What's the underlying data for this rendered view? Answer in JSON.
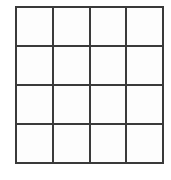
{
  "figure": {
    "name": "empty-4x4-grid",
    "type": "grid",
    "rows": 4,
    "columns": 4,
    "cell_count": 16,
    "line_color": "#3a3a3a",
    "line_width_px": 2,
    "cell_fill_color": "#fdfdfd",
    "background_color": "#ffffff",
    "geometry": {
      "left_px": 15,
      "top_px": 6,
      "width_px": 149,
      "height_px": 158,
      "cell_width_px": 37.25,
      "cell_height_px": 39.5
    },
    "cells": [
      {
        "row": 1,
        "column": 1,
        "label": ""
      },
      {
        "row": 1,
        "column": 2,
        "label": ""
      },
      {
        "row": 1,
        "column": 3,
        "label": ""
      },
      {
        "row": 1,
        "column": 4,
        "label": ""
      },
      {
        "row": 2,
        "column": 1,
        "label": ""
      },
      {
        "row": 2,
        "column": 2,
        "label": ""
      },
      {
        "row": 2,
        "column": 3,
        "label": ""
      },
      {
        "row": 2,
        "column": 4,
        "label": ""
      },
      {
        "row": 3,
        "column": 1,
        "label": ""
      },
      {
        "row": 3,
        "column": 2,
        "label": ""
      },
      {
        "row": 3,
        "column": 3,
        "label": ""
      },
      {
        "row": 3,
        "column": 4,
        "label": ""
      },
      {
        "row": 4,
        "column": 1,
        "label": ""
      },
      {
        "row": 4,
        "column": 2,
        "label": ""
      },
      {
        "row": 4,
        "column": 3,
        "label": ""
      },
      {
        "row": 4,
        "column": 4,
        "label": ""
      }
    ]
  }
}
